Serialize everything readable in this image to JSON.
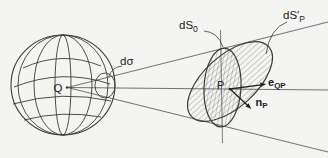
{
  "figure": {
    "name": "solid-angle-projection-diagram",
    "colors": {
      "paper": "#f4f4f2",
      "ink": "#3b3b3b",
      "label_ink": "#222222",
      "hatch": "#5c5c5c"
    },
    "labels": {
      "origin_point": "Q",
      "surface_point": "P",
      "solid_angle_element": "dσ",
      "cross_section_surface": {
        "base": "dS",
        "sub": "0"
      },
      "tilted_surface": {
        "base": "dS′",
        "sub": "P"
      },
      "direction_vector": {
        "base": "e",
        "sub": "QP"
      },
      "normal_vector": {
        "base": "n",
        "sub": "P"
      }
    }
  }
}
